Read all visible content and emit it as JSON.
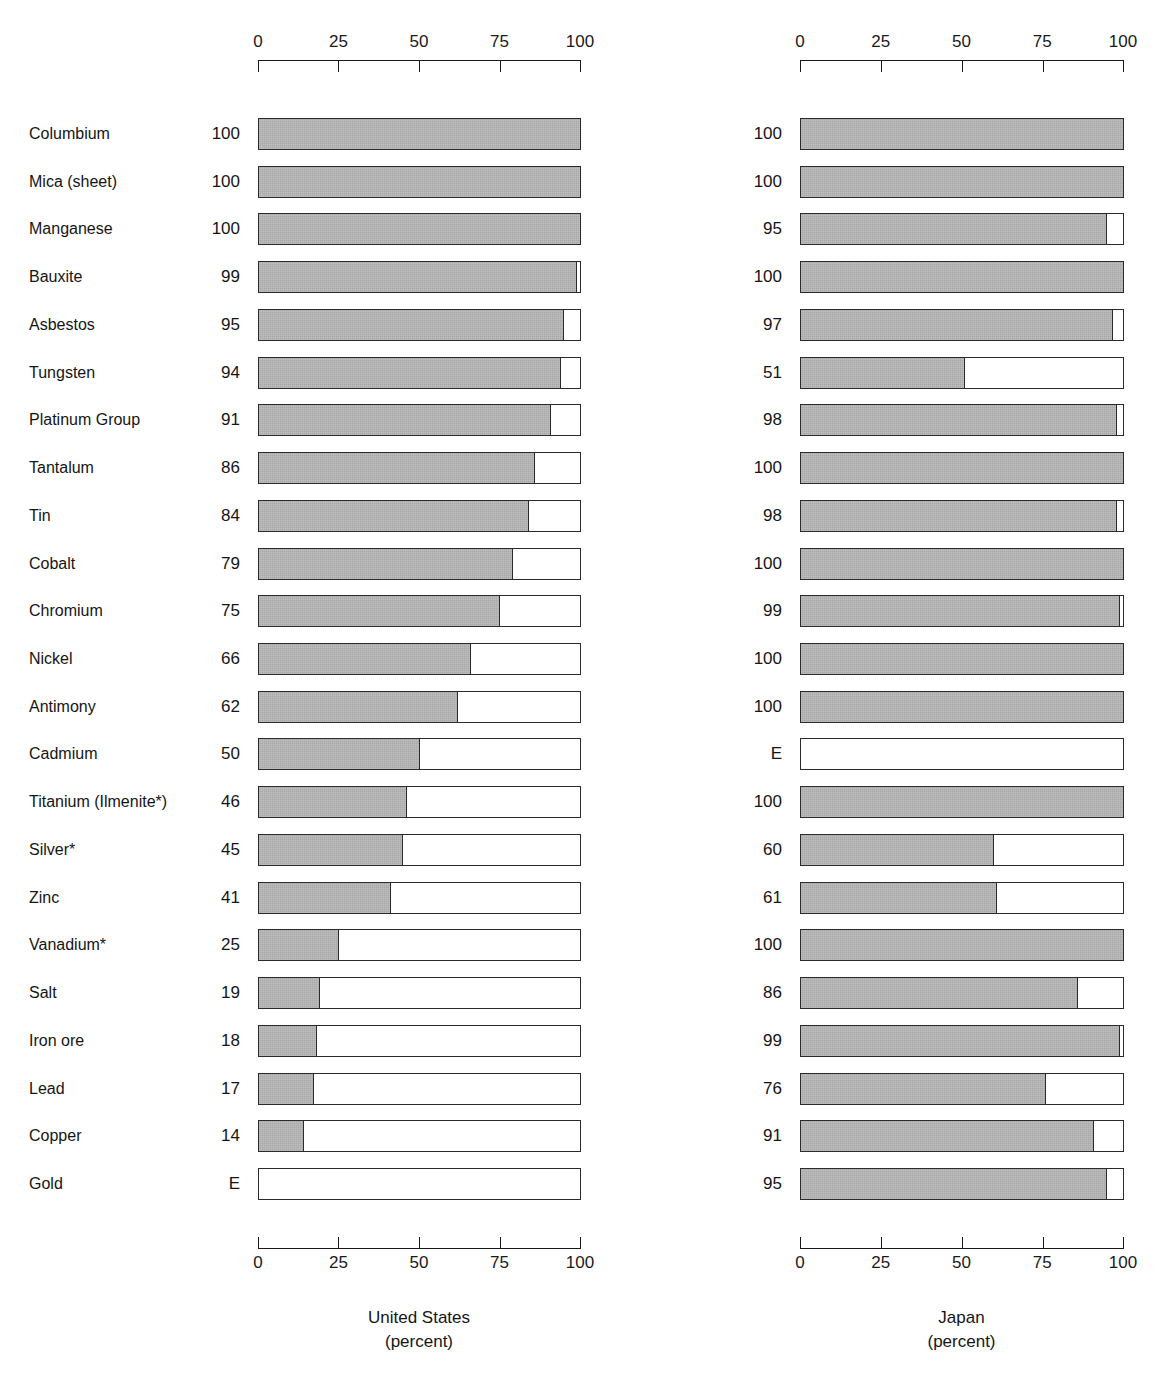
{
  "chart_data": {
    "type": "bar",
    "title": "",
    "orientation": "horizontal",
    "grid": false,
    "legend": null,
    "xlabel": "percent",
    "ylabel": "",
    "xlim": [
      0,
      100
    ],
    "axis_ticks": [
      "0",
      "25",
      "50",
      "75",
      "100"
    ],
    "axis_tick_values": [
      0,
      25,
      50,
      75,
      100
    ],
    "categories": [
      "Columbium",
      "Mica (sheet)",
      "Manganese",
      "Bauxite",
      "Asbestos",
      "Tungsten",
      "Platinum Group",
      "Tantalum",
      "Tin",
      "Cobalt",
      "Chromium",
      "Nickel",
      "Antimony",
      "Cadmium",
      "Titanium (Ilmenite*)",
      "Silver*",
      "Zinc",
      "Vanadium*",
      "Salt",
      "Iron ore",
      "Lead",
      "Copper",
      "Gold"
    ],
    "series": [
      {
        "name": "United States",
        "sublabel": "(percent)",
        "labels": [
          "100",
          "100",
          "100",
          "99",
          "95",
          "94",
          "91",
          "86",
          "84",
          "79",
          "75",
          "66",
          "62",
          "50",
          "46",
          "45",
          "41",
          "25",
          "19",
          "18",
          "17",
          "14",
          "E"
        ],
        "values": [
          100,
          100,
          100,
          99,
          95,
          94,
          91,
          86,
          84,
          79,
          75,
          66,
          62,
          50,
          46,
          45,
          41,
          25,
          19,
          18,
          17,
          14,
          0
        ]
      },
      {
        "name": "Japan",
        "sublabel": "(percent)",
        "labels": [
          "100",
          "100",
          "95",
          "100",
          "97",
          "51",
          "98",
          "100",
          "98",
          "100",
          "99",
          "100",
          "100",
          "E",
          "100",
          "60",
          "61",
          "100",
          "86",
          "99",
          "76",
          "91",
          "95"
        ],
        "values": [
          100,
          100,
          95,
          100,
          97,
          51,
          98,
          100,
          98,
          100,
          99,
          100,
          100,
          0,
          100,
          60,
          61,
          100,
          86,
          99,
          76,
          91,
          95
        ]
      }
    ],
    "notes": {
      "E_meaning": "E",
      "asterisk": "*"
    }
  },
  "style": {
    "bar_fill_color": "#a9a9a9",
    "bar_border_color": "#2b2b2b",
    "background_color": "#ffffff",
    "text_color": "#151515"
  }
}
